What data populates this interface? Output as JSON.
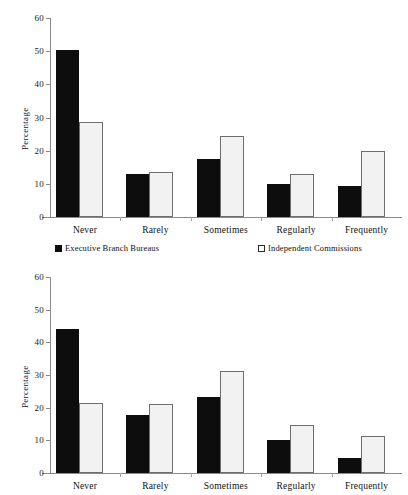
{
  "chart_data": [
    {
      "id": "top",
      "type": "bar",
      "title": "",
      "xlabel": "",
      "ylabel": "Percentage",
      "ylim": [
        0,
        60
      ],
      "yticks": [
        0,
        10,
        20,
        30,
        40,
        50,
        60
      ],
      "grid": false,
      "legend_position": "below-plot",
      "categories": [
        "Never",
        "Rarely",
        "Sometimes",
        "Regularly",
        "Frequently"
      ],
      "series": [
        {
          "name": "Executive Branch Bureaus",
          "color": "#0d0d0d",
          "values": [
            50.3,
            13.0,
            17.4,
            10.0,
            9.4
          ]
        },
        {
          "name": "Independent Commissions",
          "color": "#f2f2f2",
          "values": [
            28.5,
            13.7,
            24.5,
            13.1,
            19.8
          ]
        }
      ]
    },
    {
      "id": "bottom",
      "type": "bar",
      "title": "",
      "xlabel": "",
      "ylabel": "Percentage",
      "ylim": [
        0,
        60
      ],
      "yticks": [
        0,
        10,
        20,
        30,
        40,
        50,
        60
      ],
      "grid": false,
      "legend_position": "none",
      "categories": [
        "Never",
        "Rarely",
        "Sometimes",
        "Regularly",
        "Frequently"
      ],
      "series": [
        {
          "name": "Executive Branch Bureaus",
          "color": "#0d0d0d",
          "values": [
            44.0,
            17.7,
            23.2,
            10.2,
            4.6
          ]
        },
        {
          "name": "Independent Commissions",
          "color": "#f2f2f2",
          "values": [
            21.5,
            21.0,
            31.1,
            14.7,
            11.2
          ]
        }
      ]
    }
  ],
  "top_chart": {
    "axis_label_y": "Percentage",
    "yticks": [
      "60",
      "50",
      "40",
      "30",
      "20",
      "10",
      "0"
    ],
    "xticks": [
      "Never",
      "Rarely",
      "Sometimes",
      "Regularly",
      "Frequently"
    ]
  },
  "bottom_chart": {
    "axis_label_y": "Percentage",
    "yticks": [
      "60",
      "50",
      "40",
      "30",
      "20",
      "10",
      "0"
    ],
    "xticks": [
      "Never",
      "Rarely",
      "Sometimes",
      "Regularly",
      "Frequently"
    ]
  },
  "legend": {
    "series_a_label": "Executive Branch Bureaus",
    "series_b_label": "Independent Commissions"
  }
}
